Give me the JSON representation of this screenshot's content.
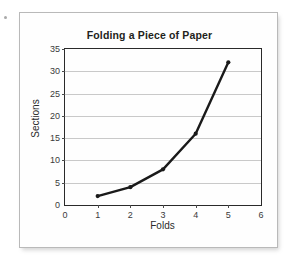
{
  "figure": {
    "background_color": "#fefefe",
    "border_color": "#b9b9b9"
  },
  "chart_data": {
    "type": "line",
    "title": "Folding a Piece of Paper",
    "xlabel": "Folds",
    "ylabel": "Sections",
    "x": [
      1,
      2,
      3,
      4,
      5
    ],
    "values": [
      2,
      4,
      8,
      16,
      32
    ],
    "series": [
      {
        "name": "Sections",
        "x": [
          1,
          2,
          3,
          4,
          5
        ],
        "values": [
          2,
          4,
          8,
          16,
          32
        ],
        "color": "#1a1a1a",
        "marker": "circle",
        "line_width": 2.4
      }
    ],
    "xlim": [
      0,
      6
    ],
    "ylim": [
      0,
      35
    ],
    "xticks": [
      0,
      1,
      2,
      3,
      4,
      5,
      6
    ],
    "yticks": [
      0,
      5,
      10,
      15,
      20,
      25,
      30,
      35
    ],
    "xtick_labels": [
      "0",
      "1",
      "2",
      "3",
      "4",
      "5",
      "6"
    ],
    "ytick_labels": [
      "0",
      "5",
      "10",
      "15",
      "20",
      "25",
      "30",
      "35"
    ],
    "grid": {
      "horizontal": true,
      "vertical": false,
      "color": "#c9c9c9"
    },
    "legend": null,
    "legend_position": "none",
    "annotations": []
  }
}
